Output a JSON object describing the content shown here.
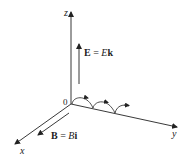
{
  "diagram": {
    "type": "3d-coordinate-axes",
    "axes": {
      "x_label": "x",
      "y_label": "y",
      "z_label": "z",
      "origin_label": "0"
    },
    "vectors": {
      "E": {
        "bold": "E",
        "eq": " = ",
        "scalar": "E",
        "unit": "k"
      },
      "B": {
        "bold": "B",
        "eq": " = ",
        "scalar": "B",
        "unit": "i"
      }
    },
    "trajectory": {
      "shape": "cycloid",
      "humps": 3,
      "direction": "+y"
    },
    "colors": {
      "line": "#222222",
      "background": "#ffffff"
    }
  }
}
